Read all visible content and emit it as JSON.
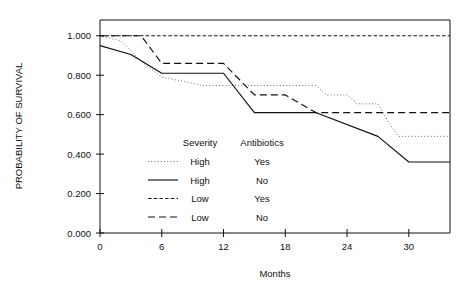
{
  "chart_data": {
    "type": "line",
    "title": "",
    "xlabel": "Months",
    "ylabel": "PROBABILITY OF SURVIVAL",
    "xlim": [
      0,
      34
    ],
    "ylim": [
      0.0,
      1.08
    ],
    "xticks": [
      0,
      6,
      12,
      18,
      24,
      30
    ],
    "xtick_labels": [
      "0",
      "6",
      "12",
      "18",
      "24",
      "30"
    ],
    "yticks": [
      0.0,
      0.2,
      0.4,
      0.6,
      0.8,
      1.0
    ],
    "ytick_labels": [
      "0.000",
      "0.200",
      "0.400",
      "0.600",
      "0.800",
      "1.000"
    ],
    "grid": false,
    "legend_position": "center",
    "legend_headers": [
      "Severity",
      "Antibiotics"
    ],
    "series": [
      {
        "name": "High / Yes",
        "severity": "High",
        "antibiotics": "Yes",
        "style": "dotted",
        "points": [
          [
            0,
            1.0
          ],
          [
            2,
            0.975
          ],
          [
            4,
            0.87
          ],
          [
            6,
            0.79
          ],
          [
            8,
            0.77
          ],
          [
            10,
            0.748
          ],
          [
            12,
            0.748
          ],
          [
            14,
            0.748
          ],
          [
            16,
            0.748
          ],
          [
            18,
            0.748
          ],
          [
            20,
            0.748
          ],
          [
            21,
            0.748
          ],
          [
            22,
            0.7
          ],
          [
            24,
            0.7
          ],
          [
            25,
            0.655
          ],
          [
            27,
            0.655
          ],
          [
            28,
            0.565
          ],
          [
            29,
            0.49
          ],
          [
            31,
            0.49
          ],
          [
            34,
            0.49
          ]
        ]
      },
      {
        "name": "High / No",
        "severity": "High",
        "antibiotics": "No",
        "style": "solid",
        "points": [
          [
            0,
            0.95
          ],
          [
            3,
            0.905
          ],
          [
            6,
            0.81
          ],
          [
            12,
            0.81
          ],
          [
            15,
            0.61
          ],
          [
            21,
            0.61
          ],
          [
            27,
            0.49
          ],
          [
            30,
            0.36
          ],
          [
            34,
            0.36
          ]
        ]
      },
      {
        "name": "Low / Yes",
        "severity": "Low",
        "antibiotics": "Yes",
        "style": "fine-dashed",
        "points": [
          [
            0,
            1.0
          ],
          [
            6,
            1.0
          ],
          [
            12,
            1.0
          ],
          [
            18,
            1.0
          ],
          [
            24,
            1.0
          ],
          [
            30,
            1.0
          ],
          [
            34,
            1.0
          ]
        ]
      },
      {
        "name": "Low / No",
        "severity": "Low",
        "antibiotics": "No",
        "style": "dashed",
        "points": [
          [
            0,
            1.0
          ],
          [
            4,
            1.0
          ],
          [
            6,
            0.86
          ],
          [
            12,
            0.86
          ],
          [
            15,
            0.7
          ],
          [
            18,
            0.7
          ],
          [
            21,
            0.61
          ],
          [
            24,
            0.61
          ],
          [
            30,
            0.61
          ],
          [
            34,
            0.61
          ]
        ]
      }
    ],
    "legend_entries": [
      {
        "style": "dotted",
        "severity": "High",
        "antibiotics": "Yes"
      },
      {
        "style": "solid",
        "severity": "High",
        "antibiotics": "No"
      },
      {
        "style": "fine-dashed",
        "severity": "Low",
        "antibiotics": "Yes"
      },
      {
        "style": "dashed",
        "severity": "Low",
        "antibiotics": "No"
      }
    ]
  },
  "colors": {
    "axis": "#111111",
    "line": "#111111",
    "background": "#ffffff"
  }
}
